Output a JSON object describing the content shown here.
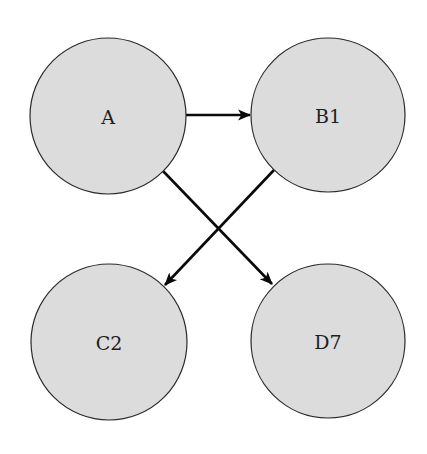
{
  "diagram": {
    "type": "directed-graph",
    "colors": {
      "node_fill": "#dcdcdc",
      "node_stroke": "#2a2a2a",
      "edge": "#0a0a0a",
      "background": "#ffffff"
    },
    "nodes": [
      {
        "id": "A",
        "label": "A",
        "cx": 108,
        "cy": 116,
        "r": 78
      },
      {
        "id": "B1",
        "label": "B1",
        "cx": 328,
        "cy": 115,
        "r": 77
      },
      {
        "id": "C2",
        "label": "C2",
        "cx": 109,
        "cy": 342,
        "r": 78
      },
      {
        "id": "D7",
        "label": "D7",
        "cx": 328,
        "cy": 341,
        "r": 77
      }
    ],
    "edges": [
      {
        "from": "A",
        "to": "B1"
      },
      {
        "from": "A",
        "to": "D7"
      },
      {
        "from": "B1",
        "to": "C2"
      }
    ]
  }
}
